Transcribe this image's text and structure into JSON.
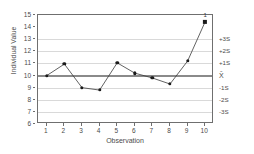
{
  "chart_data": {
    "type": "line",
    "title": "",
    "subtitle": "",
    "xlabel": "Observation",
    "ylabel": "Individual Value",
    "x": [
      1,
      2,
      3,
      4,
      5,
      6,
      7,
      8,
      9,
      10
    ],
    "xtick_labels": [
      "1",
      "2",
      "3",
      "4",
      "5",
      "6",
      "7",
      "8",
      "9",
      "10"
    ],
    "xlim": [
      0.5,
      10.5
    ],
    "ylim": [
      6,
      15
    ],
    "ytick_labels": [
      "6",
      "7",
      "8",
      "9",
      "10",
      "11",
      "12",
      "13",
      "14",
      "15"
    ],
    "yticks": [
      6,
      7,
      8,
      9,
      10,
      11,
      12,
      13,
      14,
      15
    ],
    "grid": true,
    "legend_position": "none",
    "series": [
      {
        "name": "Individual Value",
        "values": [
          10.0,
          10.95,
          9.0,
          8.8,
          11.05,
          10.2,
          9.8,
          9.3,
          11.2,
          14.45
        ],
        "marker": "circle",
        "color": "#1a1a1a"
      }
    ],
    "center_line": {
      "label": "X̄",
      "value": 10.0,
      "color": "#8a8a8a"
    },
    "sigma_lines": [
      {
        "label": "+3S",
        "value": 13.0
      },
      {
        "label": "+2S",
        "value": 12.0
      },
      {
        "label": "+1S",
        "value": 11.0
      },
      {
        "label": "X̄",
        "value": 10.0
      },
      {
        "label": "-1S",
        "value": 9.0
      },
      {
        "label": "-2S",
        "value": 8.0
      },
      {
        "label": "-3S",
        "value": 7.0
      }
    ],
    "annotations": [
      {
        "label": "1",
        "x": 10,
        "y": 14.45,
        "meaning": "out-of-control-point"
      }
    ],
    "colors": {
      "axis": "#6f6f6f",
      "grid": "#d9d9d9",
      "center_line": "#8a8a8a",
      "marker": "#1a1a1a",
      "text": "#4a4a4a",
      "background": "#ffffff"
    }
  }
}
